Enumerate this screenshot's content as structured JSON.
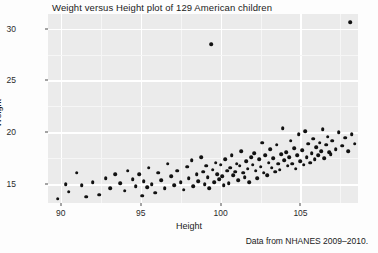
{
  "chart_data": {
    "type": "scatter",
    "title": "Weight versus Height plot of 129 American children",
    "xlabel": "Height",
    "ylabel": "Weight",
    "caption": "Data from NHANES 2009–2010.",
    "xlim": [
      89.2,
      108.6
    ],
    "ylim": [
      13.2,
      31.4
    ],
    "xticks": [
      90,
      95,
      100,
      105
    ],
    "yticks": [
      15,
      20,
      25,
      30
    ],
    "xtick_labels": [
      "90",
      "95",
      "100",
      "105"
    ],
    "ytick_labels": [
      "15",
      "20",
      "25",
      "30"
    ],
    "grid": true,
    "grid_minor": true,
    "legend": "none",
    "n_points": 129,
    "point_color": "#111111",
    "panel_color": "#ebebeb",
    "gridline_color": "#ffffff",
    "points": [
      [
        89.8,
        13.6
      ],
      [
        90.3,
        15.0
      ],
      [
        90.5,
        14.3
      ],
      [
        91.0,
        16.1
      ],
      [
        91.3,
        14.9
      ],
      [
        91.6,
        13.8
      ],
      [
        92.0,
        15.2
      ],
      [
        92.4,
        14.0
      ],
      [
        92.8,
        15.6
      ],
      [
        93.1,
        14.6
      ],
      [
        93.4,
        16.0
      ],
      [
        93.7,
        15.1
      ],
      [
        94.0,
        14.4
      ],
      [
        94.2,
        16.3
      ],
      [
        94.5,
        15.5
      ],
      [
        94.7,
        14.8
      ],
      [
        94.9,
        16.0
      ],
      [
        95.1,
        13.9
      ],
      [
        95.2,
        15.3
      ],
      [
        95.4,
        14.7
      ],
      [
        95.5,
        16.6
      ],
      [
        95.7,
        15.0
      ],
      [
        95.9,
        14.2
      ],
      [
        96.1,
        16.1
      ],
      [
        96.3,
        15.4
      ],
      [
        96.5,
        14.6
      ],
      [
        96.7,
        17.0
      ],
      [
        96.9,
        15.8
      ],
      [
        97.1,
        14.9
      ],
      [
        97.3,
        16.3
      ],
      [
        97.5,
        15.2
      ],
      [
        97.7,
        14.5
      ],
      [
        97.9,
        16.7
      ],
      [
        98.0,
        15.6
      ],
      [
        98.2,
        17.3
      ],
      [
        98.3,
        14.8
      ],
      [
        98.5,
        16.0
      ],
      [
        98.6,
        15.3
      ],
      [
        98.8,
        17.6
      ],
      [
        98.9,
        16.2
      ],
      [
        99.0,
        15.0
      ],
      [
        99.1,
        16.8
      ],
      [
        99.2,
        15.7
      ],
      [
        99.3,
        14.6
      ],
      [
        99.4,
        28.5
      ],
      [
        99.5,
        16.4
      ],
      [
        99.6,
        15.2
      ],
      [
        99.7,
        17.1
      ],
      [
        99.8,
        16.0
      ],
      [
        99.9,
        15.5
      ],
      [
        100.0,
        16.9
      ],
      [
        100.1,
        15.8
      ],
      [
        100.2,
        14.9
      ],
      [
        100.3,
        17.4
      ],
      [
        100.4,
        16.3
      ],
      [
        100.5,
        15.1
      ],
      [
        100.6,
        16.6
      ],
      [
        100.7,
        17.8
      ],
      [
        100.8,
        15.9
      ],
      [
        100.9,
        16.2
      ],
      [
        101.0,
        17.0
      ],
      [
        101.1,
        15.4
      ],
      [
        101.2,
        16.8
      ],
      [
        101.3,
        18.2
      ],
      [
        101.4,
        16.1
      ],
      [
        101.5,
        15.7
      ],
      [
        101.6,
        17.2
      ],
      [
        101.7,
        16.5
      ],
      [
        101.8,
        15.2
      ],
      [
        101.9,
        17.6
      ],
      [
        102.0,
        16.9
      ],
      [
        102.1,
        18.0
      ],
      [
        102.2,
        16.3
      ],
      [
        102.3,
        15.6
      ],
      [
        102.4,
        17.4
      ],
      [
        102.5,
        16.7
      ],
      [
        102.6,
        19.0
      ],
      [
        102.7,
        16.1
      ],
      [
        102.8,
        17.8
      ],
      [
        102.9,
        15.9
      ],
      [
        103.0,
        17.1
      ],
      [
        103.1,
        18.4
      ],
      [
        103.2,
        16.6
      ],
      [
        103.3,
        17.5
      ],
      [
        103.4,
        16.2
      ],
      [
        103.5,
        18.8
      ],
      [
        103.6,
        17.0
      ],
      [
        103.7,
        16.4
      ],
      [
        103.8,
        17.9
      ],
      [
        103.9,
        20.4
      ],
      [
        104.0,
        17.3
      ],
      [
        104.1,
        18.1
      ],
      [
        104.2,
        16.8
      ],
      [
        104.3,
        17.6
      ],
      [
        104.4,
        19.2
      ],
      [
        104.5,
        17.0
      ],
      [
        104.6,
        18.5
      ],
      [
        104.7,
        16.5
      ],
      [
        104.8,
        17.8
      ],
      [
        104.9,
        19.8
      ],
      [
        105.0,
        17.2
      ],
      [
        105.1,
        18.3
      ],
      [
        105.2,
        16.9
      ],
      [
        105.3,
        20.1
      ],
      [
        105.4,
        17.6
      ],
      [
        105.5,
        18.9
      ],
      [
        105.6,
        17.1
      ],
      [
        105.7,
        18.0
      ],
      [
        105.8,
        19.4
      ],
      [
        105.9,
        17.4
      ],
      [
        106.0,
        18.6
      ],
      [
        106.1,
        17.8
      ],
      [
        106.2,
        19.0
      ],
      [
        106.3,
        18.2
      ],
      [
        106.4,
        20.3
      ],
      [
        106.5,
        17.5
      ],
      [
        106.6,
        18.8
      ],
      [
        106.7,
        19.6
      ],
      [
        106.8,
        18.1
      ],
      [
        106.9,
        17.9
      ],
      [
        107.0,
        19.2
      ],
      [
        107.2,
        18.4
      ],
      [
        107.4,
        20.0
      ],
      [
        107.6,
        18.7
      ],
      [
        107.8,
        19.5
      ],
      [
        108.0,
        18.2
      ],
      [
        108.2,
        19.8
      ],
      [
        108.4,
        18.9
      ],
      [
        108.1,
        30.6
      ]
    ]
  }
}
